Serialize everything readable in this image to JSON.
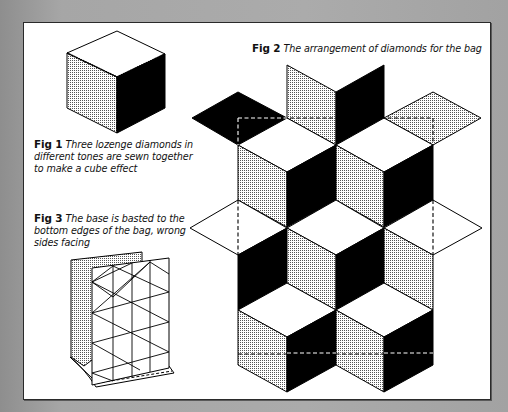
{
  "figures": {
    "fig1": {
      "label": "Fig 1",
      "text": "Three lozenge diamonds in different tones are sewn together to make a cube effect"
    },
    "fig2": {
      "label": "Fig 2",
      "text": "The arrangement of diamonds for the bag"
    },
    "fig3": {
      "label": "Fig 3",
      "text": "The base is basted to the bottom edges of the bag, wrong sides facing"
    }
  },
  "colors": {
    "background": "#a8a8a8",
    "page": "#ffffff",
    "ink": "#000000",
    "stipple": "#d8d8d8"
  }
}
